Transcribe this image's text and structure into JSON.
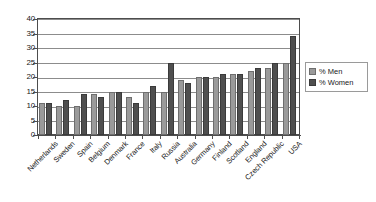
{
  "chart_data": {
    "type": "bar",
    "title": "",
    "subtitle": "",
    "xlabel": "",
    "ylabel": "",
    "ylim": [
      0,
      40
    ],
    "ytick_step": 5,
    "yticks": [
      "40",
      "35",
      "30",
      "25",
      "20",
      "15",
      "10",
      "5",
      "0"
    ],
    "grid": true,
    "legend_position": "right",
    "orientation": "vertical",
    "grouping": "grouped",
    "categories": [
      "Netherlands",
      "Sweden",
      "Spain",
      "Belgium",
      "Denmark",
      "France",
      "Italy",
      "Russia",
      "Australia",
      "Germany",
      "Finland",
      "Scotland",
      "England",
      "Czech Republic",
      "USA"
    ],
    "series": [
      {
        "name": "% Men",
        "color": "#9a9a9a",
        "values": [
          11,
          10,
          10,
          14,
          15,
          13,
          15,
          15,
          19,
          20,
          20,
          21,
          22,
          23,
          25
        ]
      },
      {
        "name": "% Women",
        "color": "#4f4f4f",
        "values": [
          11,
          12,
          14,
          13,
          15,
          11,
          17,
          25,
          18,
          20,
          21,
          21,
          23,
          25,
          34
        ]
      }
    ],
    "annotations": []
  },
  "legend": {
    "items": [
      {
        "label": "% Men"
      },
      {
        "label": "% Women"
      }
    ]
  },
  "colors": {
    "men": "#9a9a9a",
    "women": "#4f4f4f",
    "axis": "#4d4d4d",
    "grid": "#8c8c8c",
    "background": "#ffffff",
    "text": "#1a1a1a"
  }
}
